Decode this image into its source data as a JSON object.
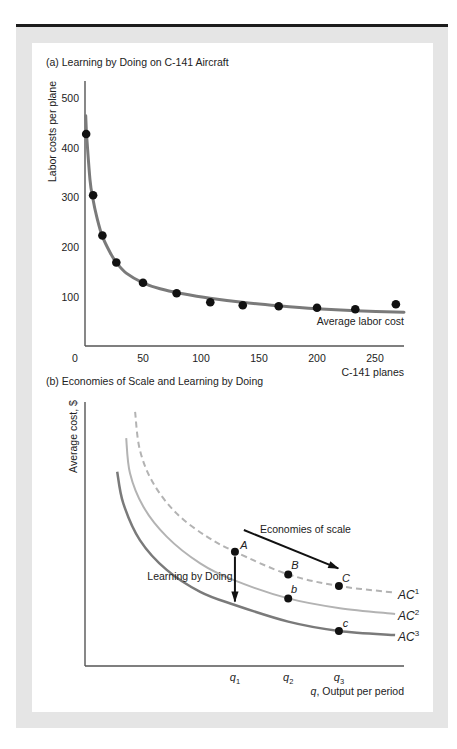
{
  "figure": {
    "panel_a_title": "(a) Learning by Doing on C-141 Aircraft",
    "panel_b_title": "(b) Economies of Scale and Learning by Doing"
  },
  "style": {
    "frame_color": "#e5e5e5",
    "rule_color": "#1c1c1c",
    "axis_color": "#555555",
    "dot_color": "#111111"
  },
  "chart_data": [
    {
      "id": "panel_a",
      "type": "scatter",
      "title": "(a) Learning by Doing on C-141 Aircraft",
      "xlabel": "C-141 planes",
      "ylabel": "Labor costs per plane",
      "xlim": [
        0,
        275
      ],
      "ylim": [
        0,
        530
      ],
      "x_ticks": [
        0,
        50,
        100,
        150,
        200,
        250
      ],
      "y_ticks": [
        100,
        200,
        300,
        400,
        500
      ],
      "grid": false,
      "legend": "none",
      "series": [
        {
          "name": "Observed labor cost per plane",
          "type": "scatter",
          "color": "#111111",
          "points": [
            [
              1,
              428
            ],
            [
              7,
              305
            ],
            [
              15,
              224
            ],
            [
              27,
              170
            ],
            [
              50,
              129
            ],
            [
              79,
              108
            ],
            [
              108,
              90
            ],
            [
              136,
              84
            ],
            [
              167,
              82
            ],
            [
              200,
              79
            ],
            [
              233,
              76
            ],
            [
              268,
              86
            ]
          ]
        },
        {
          "name": "Average labor cost",
          "type": "line",
          "color": "#7a7a7a",
          "points": [
            [
              0.6,
              465
            ],
            [
              1.5,
              423
            ],
            [
              4.3,
              336
            ],
            [
              6.6,
              300
            ],
            [
              10.1,
              262
            ],
            [
              14.7,
              224
            ],
            [
              21.6,
              190
            ],
            [
              27,
              170
            ],
            [
              35.9,
              148
            ],
            [
              50,
              129
            ],
            [
              64.7,
              117
            ],
            [
              81.9,
              108
            ],
            [
              107.8,
              98
            ],
            [
              135.6,
              90
            ],
            [
              166.6,
              83
            ],
            [
              199.7,
              77
            ],
            [
              233.4,
              73
            ],
            [
              275,
              70
            ]
          ]
        }
      ]
    },
    {
      "id": "panel_b",
      "type": "line",
      "title": "(b) Economies of Scale and Learning by Doing",
      "xlabel": {
        "var": "q",
        "text": ", Output per period"
      },
      "ylabel": "Average cost, $",
      "xlim": [
        0,
        100
      ],
      "ylim": [
        0,
        100
      ],
      "grid": false,
      "x_ticks": [
        {
          "x": 47.0,
          "var": "q",
          "sub": "1"
        },
        {
          "x": 63.7,
          "var": "q",
          "sub": "2"
        },
        {
          "x": 79.6,
          "var": "q",
          "sub": "3"
        }
      ],
      "series": [
        {
          "name": "AC1",
          "label": "AC",
          "sup": "1",
          "style": "dashed",
          "color": "#b3b3b3",
          "width": 2,
          "points": [
            [
              15.7,
              96.3
            ],
            [
              17.2,
              81.8
            ],
            [
              21.4,
              69.2
            ],
            [
              28.7,
              57.8
            ],
            [
              38.2,
              49.0
            ],
            [
              47.0,
              43.3
            ],
            [
              63.7,
              34.7
            ],
            [
              79.6,
              30.3
            ],
            [
              97.2,
              27.8
            ]
          ]
        },
        {
          "name": "AC2",
          "label": "AC",
          "sup": "2",
          "style": "solid",
          "color": "#b3b3b3",
          "width": 2,
          "points": [
            [
              12.9,
              86.3
            ],
            [
              14.1,
              73.0
            ],
            [
              18.3,
              60.3
            ],
            [
              25.6,
              49.0
            ],
            [
              36.1,
              38.9
            ],
            [
              46.5,
              32.6
            ],
            [
              63.7,
              25.6
            ],
            [
              79.9,
              21.9
            ],
            [
              97.2,
              19.7
            ]
          ]
        },
        {
          "name": "AC3",
          "label": "AC",
          "sup": "3",
          "style": "solid",
          "color": "#7a7a7a",
          "width": 2.5,
          "points": [
            [
              10.1,
              73.6
            ],
            [
              12.0,
              61.6
            ],
            [
              17.2,
              47.7
            ],
            [
              25.6,
              36.4
            ],
            [
              36.1,
              28.1
            ],
            [
              47.0,
              23.1
            ],
            [
              63.7,
              16.8
            ],
            [
              79.6,
              13.3
            ],
            [
              97.2,
              11.7
            ]
          ]
        }
      ],
      "points": [
        {
          "label": "A",
          "x": 47.0,
          "y": 43.3,
          "label_x": 49.8,
          "label_y": 45.5,
          "curve": "AC1"
        },
        {
          "label": "B",
          "x": 63.7,
          "y": 34.7,
          "label_x": 65.8,
          "label_y": 38.0,
          "curve": "AC1"
        },
        {
          "label": "C",
          "x": 79.6,
          "y": 30.3,
          "label_x": 81.8,
          "label_y": 33.0,
          "curve": "AC1"
        },
        {
          "label": "b",
          "x": 63.7,
          "y": 25.6,
          "label_x": 65.5,
          "label_y": 28.7,
          "curve": "AC2"
        },
        {
          "label": "c",
          "x": 79.6,
          "y": 13.3,
          "label_x": 81.7,
          "label_y": 15.8,
          "curve": "AC3"
        }
      ],
      "arrows": [
        {
          "label": "Economies of scale",
          "from": [
            49.8,
            51.5
          ],
          "to": [
            79.4,
            37.0
          ],
          "label_x": 69.1,
          "label_y": 51.8
        },
        {
          "label": "Learning by Doing",
          "from": [
            47.0,
            41.5
          ],
          "to": [
            47.0,
            24.4
          ],
          "label_x": 32.9,
          "label_y": 33.8
        }
      ]
    }
  ]
}
